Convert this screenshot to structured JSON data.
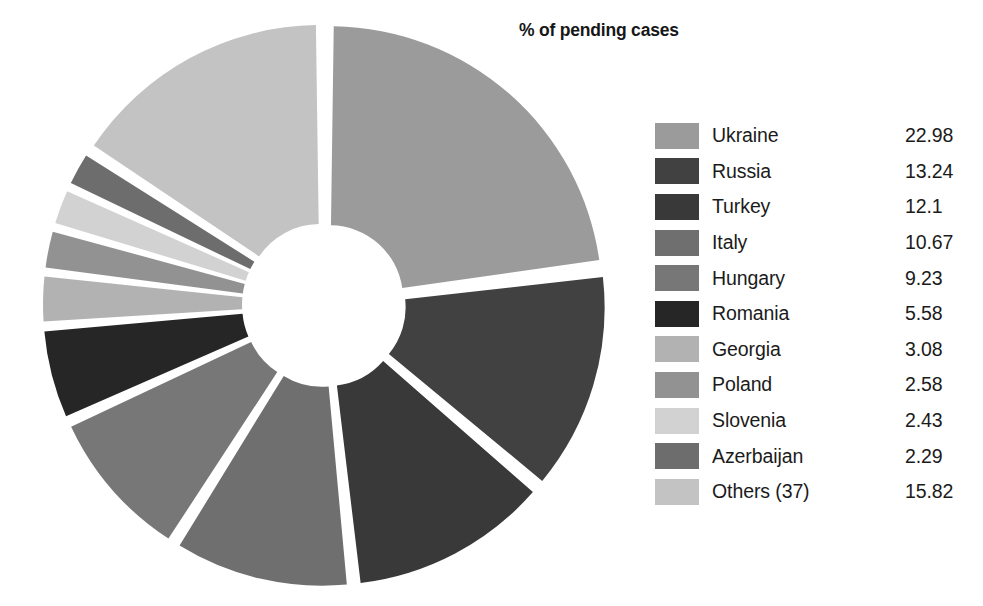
{
  "chart_title": "% of pending cases",
  "legend": {
    "rows": [
      {
        "label": "Ukraine",
        "value": "22.98",
        "color": "#9b9b9b"
      },
      {
        "label": "Russia",
        "value": "13.24",
        "color": "#414141"
      },
      {
        "label": "Turkey",
        "value": "12.1",
        "color": "#393939"
      },
      {
        "label": "Italy",
        "value": "10.67",
        "color": "#6f6f6f"
      },
      {
        "label": "Hungary",
        "value": "9.23",
        "color": "#777777"
      },
      {
        "label": "Romania",
        "value": "5.58",
        "color": "#262626"
      },
      {
        "label": "Georgia",
        "value": "3.08",
        "color": "#b2b2b2"
      },
      {
        "label": "Poland",
        "value": "2.58",
        "color": "#929292"
      },
      {
        "label": "Slovenia",
        "value": "2.43",
        "color": "#d2d2d2"
      },
      {
        "label": "Azerbaijan",
        "value": "2.29",
        "color": "#6d6d6d"
      },
      {
        "label": "Others (37)",
        "value": "15.82",
        "color": "#c3c3c3"
      }
    ]
  },
  "chart_data": {
    "type": "pie",
    "variant": "doughnut-exploded",
    "title": "% of pending cases",
    "unit": "percent",
    "labels": [
      "Ukraine",
      "Russia",
      "Turkey",
      "Italy",
      "Hungary",
      "Romania",
      "Georgia",
      "Poland",
      "Slovenia",
      "Azerbaijan",
      "Others (37)"
    ],
    "values": [
      22.98,
      13.24,
      12.1,
      10.67,
      9.23,
      5.58,
      3.08,
      2.58,
      2.43,
      2.29,
      15.82
    ],
    "colors": [
      "#9b9b9b",
      "#414141",
      "#393939",
      "#6f6f6f",
      "#777777",
      "#262626",
      "#b2b2b2",
      "#929292",
      "#d2d2d2",
      "#6d6d6d",
      "#c3c3c3"
    ],
    "total": 100.0,
    "start_angle_deg": 0,
    "direction": "clockwise",
    "legend_position": "right",
    "grid": false,
    "xlabel": "",
    "ylabel": ""
  },
  "geometry": {
    "cx": 324,
    "cy": 305,
    "outer_radius": 272,
    "inner_radius": 73,
    "explode": 9
  }
}
